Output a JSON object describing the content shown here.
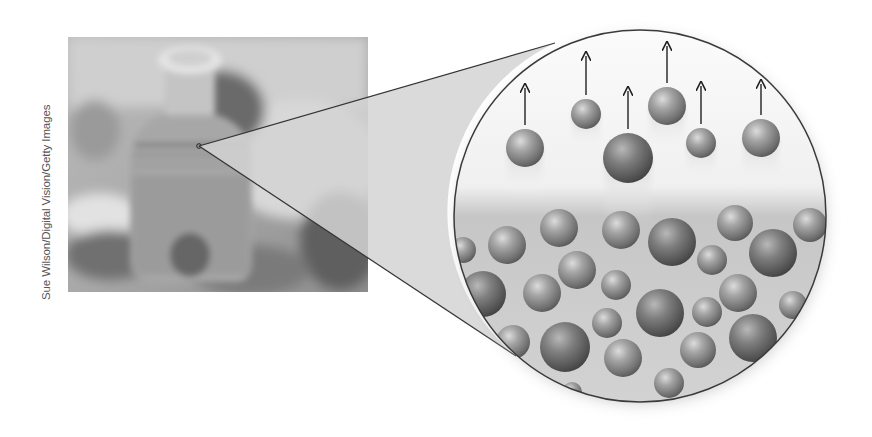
{
  "figure": {
    "photo_credit": "Sue Wilson/Digital Vision/Getty Images",
    "magnified_view": {
      "description": "molecular view of evaporation at liquid surface",
      "colors": {
        "sphere_light": "#d6d6d6",
        "sphere_mid": "#8e8e8e",
        "sphere_dark": "#4a4a4a",
        "gas_bg": "#f6f6f6",
        "liquid_bg": "#c9c9c9",
        "outline": "#444444",
        "cone_fill": "#d4d4d4"
      },
      "gas_molecules": [
        {
          "cx": 525,
          "cy": 148,
          "r": 19,
          "arrow_top": 88
        },
        {
          "cx": 586,
          "cy": 114,
          "r": 15,
          "arrow_top": 56
        },
        {
          "cx": 628,
          "cy": 158,
          "r": 25,
          "arrow_top": 91
        },
        {
          "cx": 667,
          "cy": 106,
          "r": 19,
          "arrow_top": 46
        },
        {
          "cx": 701,
          "cy": 143,
          "r": 15,
          "arrow_top": 86
        },
        {
          "cx": 761,
          "cy": 138,
          "r": 19,
          "arrow_top": 84
        }
      ],
      "liquid_molecules": [
        {
          "cx": 463,
          "cy": 250,
          "r": 13
        },
        {
          "cx": 507,
          "cy": 245,
          "r": 19
        },
        {
          "cx": 559,
          "cy": 228,
          "r": 19
        },
        {
          "cx": 621,
          "cy": 230,
          "r": 19
        },
        {
          "cx": 577,
          "cy": 270,
          "r": 19
        },
        {
          "cx": 616,
          "cy": 285,
          "r": 15
        },
        {
          "cx": 483,
          "cy": 294,
          "r": 23
        },
        {
          "cx": 542,
          "cy": 293,
          "r": 19
        },
        {
          "cx": 672,
          "cy": 242,
          "r": 24
        },
        {
          "cx": 735,
          "cy": 223,
          "r": 18
        },
        {
          "cx": 712,
          "cy": 260,
          "r": 15
        },
        {
          "cx": 773,
          "cy": 253,
          "r": 24
        },
        {
          "cx": 810,
          "cy": 225,
          "r": 17
        },
        {
          "cx": 738,
          "cy": 293,
          "r": 19
        },
        {
          "cx": 793,
          "cy": 305,
          "r": 14
        },
        {
          "cx": 513,
          "cy": 342,
          "r": 17
        },
        {
          "cx": 565,
          "cy": 347,
          "r": 25
        },
        {
          "cx": 607,
          "cy": 323,
          "r": 15
        },
        {
          "cx": 623,
          "cy": 358,
          "r": 19
        },
        {
          "cx": 660,
          "cy": 313,
          "r": 24
        },
        {
          "cx": 707,
          "cy": 312,
          "r": 15
        },
        {
          "cx": 753,
          "cy": 338,
          "r": 24
        },
        {
          "cx": 698,
          "cy": 350,
          "r": 18
        },
        {
          "cx": 669,
          "cy": 383,
          "r": 15
        },
        {
          "cx": 572,
          "cy": 392,
          "r": 10
        }
      ]
    }
  }
}
